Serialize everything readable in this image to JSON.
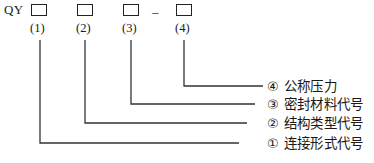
{
  "diagram": {
    "prefix": "QY",
    "separator": "–",
    "line_color": "#333333",
    "box_border_color": "#222222",
    "background": "#ffffff",
    "slots": [
      {
        "id": 1,
        "number_label": "(1)",
        "box_value": ""
      },
      {
        "id": 2,
        "number_label": "(2)",
        "box_value": ""
      },
      {
        "id": 3,
        "number_label": "(3)",
        "box_value": ""
      },
      {
        "id": 4,
        "number_label": "(4)",
        "box_value": ""
      }
    ],
    "legend": [
      {
        "marker": "④",
        "text": "公称压力"
      },
      {
        "marker": "③",
        "text": "密封材料代号"
      },
      {
        "marker": "②",
        "text": "结构类型代号"
      },
      {
        "marker": "①",
        "text": "连接形式代号"
      }
    ]
  }
}
